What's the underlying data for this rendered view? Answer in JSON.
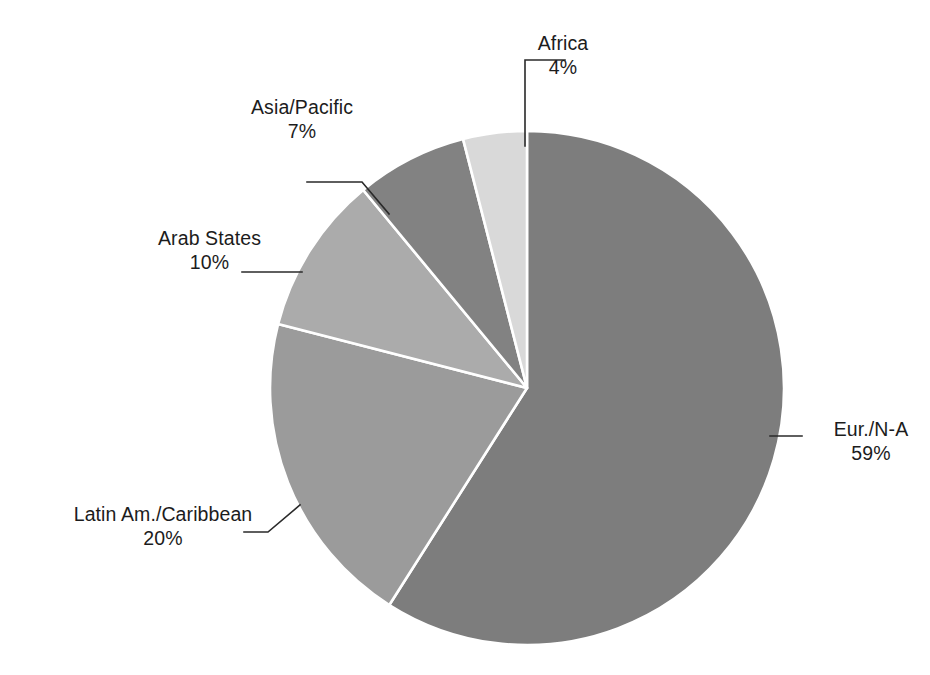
{
  "chart_data": {
    "type": "pie",
    "title": "",
    "subtitle": "",
    "xlabel": "",
    "ylabel": "",
    "legend_position": "none",
    "grid": false,
    "labels_show_percent": true,
    "start_angle_deg": 0,
    "direction": "clockwise",
    "categories": [
      "Eur./N-A",
      "Latin Am./Caribbean",
      "Arab States",
      "Asia/Pacific",
      "Africa"
    ],
    "values": [
      59,
      20,
      10,
      7,
      4
    ],
    "value_labels": [
      "59%",
      "20%",
      "10%",
      "7%",
      "4%"
    ],
    "units": "percent",
    "total": 100,
    "slices": [
      {
        "name": "Eur./N-A",
        "value": 59,
        "value_label": "59%",
        "color": "#7d7d7d",
        "start_deg": 0.0,
        "end_deg": 212.4
      },
      {
        "name": "Latin Am./Caribbean",
        "value": 20,
        "value_label": "20%",
        "color": "#9b9b9b",
        "start_deg": 212.4,
        "end_deg": 284.4
      },
      {
        "name": "Arab States",
        "value": 10,
        "value_label": "10%",
        "color": "#ababab",
        "start_deg": 284.4,
        "end_deg": 320.4
      },
      {
        "name": "Asia/Pacific",
        "value": 7,
        "value_label": "7%",
        "color": "#828282",
        "start_deg": 320.4,
        "end_deg": 345.6
      },
      {
        "name": "Africa",
        "value": 4,
        "value_label": "4%",
        "color": "#d9d9d9",
        "start_deg": 345.6,
        "end_deg": 360.0
      }
    ]
  },
  "labels": {
    "africa": {
      "name": "Africa",
      "percent": "4%"
    },
    "asia_pacific": {
      "name": "Asia/Pacific",
      "percent": "7%"
    },
    "arab_states": {
      "name": "Arab States",
      "percent": "10%"
    },
    "latin_america": {
      "name": "Latin Am./Caribbean",
      "percent": "20%"
    },
    "eur_na": {
      "name": "Eur./N-A",
      "percent": "59%"
    }
  },
  "style": {
    "background": "#ffffff",
    "slice_border": "#ffffff",
    "leader_line": "#2a2a2a",
    "text_color": "#1c1c1c"
  }
}
